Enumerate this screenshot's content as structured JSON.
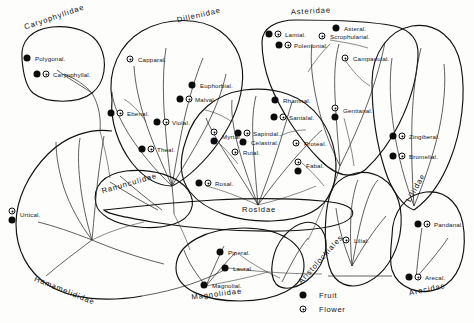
{
  "figure": {
    "type": "phylogenetic-bubble-diagram"
  },
  "legend": {
    "items": [
      {
        "symbol": "fruit",
        "label": "Fruit"
      },
      {
        "symbol": "flower",
        "label": "Flower"
      }
    ]
  },
  "subclasses": [
    {
      "id": "caryophyllidae",
      "label": "Caryophyllidae",
      "x": 26,
      "y": 27,
      "rotate": -19
    },
    {
      "id": "dilleniidae",
      "label": "Dilleniidae",
      "x": 178,
      "y": 20,
      "rotate": -13
    },
    {
      "id": "asteridae",
      "label": "Asteridae",
      "x": 291,
      "y": 12,
      "rotate": -3
    },
    {
      "id": "ranunculidae",
      "label": "Ranunculidae",
      "x": 103,
      "y": 191,
      "rotate": -16
    },
    {
      "id": "rosidae",
      "label": "Rosidae",
      "x": 242,
      "y": 209,
      "rotate": 0
    },
    {
      "id": "liliidae",
      "label": "Liliidae",
      "x": 412,
      "y": 199,
      "rotate": -61
    },
    {
      "id": "hamamelididae",
      "label": "Hamamelididae",
      "x": 33,
      "y": 278,
      "rotate": 22
    },
    {
      "id": "magnoliidae",
      "label": "Magnoliidae",
      "x": 192,
      "y": 297,
      "rotate": -7
    },
    {
      "id": "aristolochiales",
      "label": "Aristolochiales",
      "x": 303,
      "y": 281,
      "rotate": -48
    },
    {
      "id": "arecidae",
      "label": "Arecidae",
      "x": 410,
      "y": 293,
      "rotate": -12
    }
  ],
  "orders": [
    {
      "id": "polygonal",
      "label": "Polygonal.",
      "lx": 35,
      "ly": 58,
      "symbols": [
        {
          "type": "fruit",
          "x": 27,
          "y": 58
        }
      ]
    },
    {
      "id": "caryophyllal",
      "label": "Caryophyllal.",
      "lx": 53,
      "ly": 74,
      "symbols": [
        {
          "type": "fruit",
          "x": 37,
          "y": 74
        },
        {
          "type": "flower",
          "x": 46,
          "y": 74
        }
      ]
    },
    {
      "id": "capparal",
      "label": "Capparal.",
      "lx": 138,
      "ly": 59,
      "symbols": [
        {
          "type": "flower",
          "x": 130,
          "y": 59
        }
      ]
    },
    {
      "id": "ebenal",
      "label": "Ebenal.",
      "lx": 127,
      "ly": 113,
      "symbols": [
        {
          "type": "fruit",
          "x": 111,
          "y": 113
        },
        {
          "type": "flower",
          "x": 120,
          "y": 113
        }
      ]
    },
    {
      "id": "euphorbial",
      "label": "Euphorbial.",
      "lx": 200,
      "ly": 85,
      "symbols": [
        {
          "type": "fruit",
          "x": 192,
          "y": 85
        }
      ]
    },
    {
      "id": "malval",
      "label": "Malval.",
      "lx": 195,
      "ly": 99,
      "symbols": [
        {
          "type": "fruit",
          "x": 180,
          "y": 99
        },
        {
          "type": "flower",
          "x": 189,
          "y": 99
        }
      ]
    },
    {
      "id": "violal",
      "label": "Violal.",
      "lx": 172,
      "ly": 122,
      "symbols": [
        {
          "type": "fruit",
          "x": 157,
          "y": 122
        },
        {
          "type": "flower",
          "x": 166,
          "y": 122
        }
      ]
    },
    {
      "id": "theal",
      "label": "Theal.",
      "lx": 157,
      "ly": 149,
      "symbols": [
        {
          "type": "fruit",
          "x": 142,
          "y": 149
        },
        {
          "type": "flower",
          "x": 151,
          "y": 149
        }
      ]
    },
    {
      "id": "lamial",
      "label": "Lamial.",
      "lx": 285,
      "ly": 34,
      "symbols": [
        {
          "type": "fruit",
          "x": 269,
          "y": 34
        },
        {
          "type": "flower",
          "x": 278,
          "y": 34
        }
      ]
    },
    {
      "id": "polemonial",
      "label": "Polemonial.",
      "lx": 294,
      "ly": 45,
      "symbols": [
        {
          "type": "fruit",
          "x": 279,
          "y": 45
        },
        {
          "type": "flower",
          "x": 288,
          "y": 45
        }
      ]
    },
    {
      "id": "asteral",
      "label": "Asteral.",
      "lx": 344,
      "ly": 28,
      "symbols": [
        {
          "type": "fruit",
          "x": 336,
          "y": 28
        }
      ]
    },
    {
      "id": "scrophularial",
      "label": "Scrophularial.",
      "lx": 330,
      "ly": 36,
      "symbols": [
        {
          "type": "flower",
          "x": 322,
          "y": 36
        }
      ]
    },
    {
      "id": "campanulal",
      "label": "Campanulal.",
      "lx": 353,
      "ly": 58,
      "symbols": [
        {
          "type": "flower",
          "x": 345,
          "y": 58
        }
      ]
    },
    {
      "id": "gentianal",
      "label": "Gentianal.",
      "lx": 343,
      "ly": 110,
      "symbols": [
        {
          "type": "flower",
          "x": 335,
          "y": 108
        },
        {
          "type": "fruit",
          "x": 335,
          "y": 117
        }
      ]
    },
    {
      "id": "rhamnal",
      "label": "Rhamnal.",
      "lx": 283,
      "ly": 100,
      "symbols": [
        {
          "type": "fruit",
          "x": 275,
          "y": 100
        }
      ]
    },
    {
      "id": "santalal",
      "label": "Santalal.",
      "lx": 289,
      "ly": 117,
      "symbols": [
        {
          "type": "fruit",
          "x": 274,
          "y": 117
        },
        {
          "type": "flower",
          "x": 283,
          "y": 117
        }
      ]
    },
    {
      "id": "sapindal",
      "label": "Sapindal.",
      "lx": 253,
      "ly": 133,
      "symbols": [
        {
          "type": "fruit",
          "x": 238,
          "y": 133
        },
        {
          "type": "flower",
          "x": 247,
          "y": 133
        }
      ]
    },
    {
      "id": "celastral",
      "label": "Celastral.",
      "lx": 251,
      "ly": 142,
      "symbols": [
        {
          "type": "fruit",
          "x": 243,
          "y": 142
        }
      ]
    },
    {
      "id": "rutal",
      "label": "Rutal.",
      "lx": 243,
      "ly": 152,
      "symbols": [
        {
          "type": "flower",
          "x": 235,
          "y": 152
        }
      ]
    },
    {
      "id": "proteal",
      "label": "Proteal.",
      "lx": 304,
      "ly": 143,
      "symbols": [
        {
          "type": "flower",
          "x": 296,
          "y": 143
        }
      ]
    },
    {
      "id": "fabal",
      "label": "Fabal.",
      "lx": 306,
      "ly": 165,
      "symbols": [
        {
          "type": "flower",
          "x": 298,
          "y": 162
        },
        {
          "type": "fruit",
          "x": 298,
          "y": 171
        }
      ]
    },
    {
      "id": "myrtal",
      "label": "Myrtal.",
      "lx": 222,
      "ly": 136,
      "symbols": [
        {
          "type": "flower",
          "x": 214,
          "y": 132
        },
        {
          "type": "fruit",
          "x": 214,
          "y": 141
        }
      ]
    },
    {
      "id": "rosal",
      "label": "Rosal.",
      "lx": 215,
      "ly": 183,
      "symbols": [
        {
          "type": "fruit",
          "x": 199,
          "y": 183
        },
        {
          "type": "flower",
          "x": 208,
          "y": 183
        }
      ]
    },
    {
      "id": "zingiberal",
      "label": "Zingiberal.",
      "lx": 409,
      "ly": 136,
      "symbols": [
        {
          "type": "fruit",
          "x": 393,
          "y": 136
        },
        {
          "type": "flower",
          "x": 402,
          "y": 136
        }
      ]
    },
    {
      "id": "bromelial",
      "label": "Bromelial.",
      "lx": 409,
      "ly": 156,
      "symbols": [
        {
          "type": "fruit",
          "x": 393,
          "y": 156
        },
        {
          "type": "flower",
          "x": 402,
          "y": 156
        }
      ]
    },
    {
      "id": "lilial",
      "label": "Lilial.",
      "lx": 354,
      "ly": 240,
      "symbols": [
        {
          "type": "flower",
          "x": 346,
          "y": 240
        }
      ]
    },
    {
      "id": "pandanal",
      "label": "Pandanal.",
      "lx": 434,
      "ly": 224,
      "symbols": [
        {
          "type": "fruit",
          "x": 418,
          "y": 224
        },
        {
          "type": "flower",
          "x": 427,
          "y": 224
        }
      ]
    },
    {
      "id": "arecal",
      "label": "Arecal.",
      "lx": 425,
      "ly": 277,
      "symbols": [
        {
          "type": "fruit",
          "x": 409,
          "y": 277
        },
        {
          "type": "flower",
          "x": 418,
          "y": 277
        }
      ]
    },
    {
      "id": "urtical",
      "label": "Urtical.",
      "lx": 20,
      "ly": 214,
      "symbols": [
        {
          "type": "flower",
          "x": 12,
          "y": 211
        },
        {
          "type": "fruit",
          "x": 12,
          "y": 220
        }
      ]
    },
    {
      "id": "piperal",
      "label": "Piperal.",
      "lx": 228,
      "ly": 252,
      "symbols": [
        {
          "type": "fruit",
          "x": 220,
          "y": 252
        }
      ]
    },
    {
      "id": "laural",
      "label": "Laural.",
      "lx": 233,
      "ly": 268,
      "symbols": [
        {
          "type": "fruit",
          "x": 225,
          "y": 268
        }
      ]
    },
    {
      "id": "magnolial",
      "label": "Magnolial.",
      "lx": 212,
      "ly": 285,
      "symbols": [
        {
          "type": "fruit",
          "x": 204,
          "y": 285
        }
      ]
    }
  ],
  "colors": {
    "ink": "#111111",
    "paper": "#fdfdfb",
    "fruit_fill": "#0c0c0c",
    "flower_fill": "#ffffff"
  }
}
